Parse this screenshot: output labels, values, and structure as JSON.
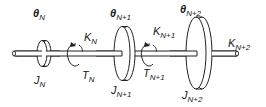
{
  "diagram": {
    "colors": {
      "line": "#222222",
      "background": "#ffffff"
    },
    "disks": [
      {
        "angle_symbol": "θ",
        "angle_subscript": "N",
        "inertia_symbol": "J",
        "inertia_subscript": "N"
      },
      {
        "angle_symbol": "θ",
        "angle_subscript": "N+1",
        "inertia_symbol": "J",
        "inertia_subscript": "N+1"
      },
      {
        "angle_symbol": "θ",
        "angle_subscript": "N+2",
        "inertia_symbol": "J",
        "inertia_subscript": "N+2"
      }
    ],
    "springs": [
      {
        "stiffness_symbol": "K",
        "stiffness_subscript": "N",
        "torque_symbol": "T",
        "torque_subscript": "N"
      },
      {
        "stiffness_symbol": "K",
        "stiffness_subscript": "N+1",
        "torque_symbol": "T",
        "torque_subscript": "N+1"
      },
      {
        "stiffness_symbol": "K",
        "stiffness_subscript": "N+2"
      }
    ]
  }
}
